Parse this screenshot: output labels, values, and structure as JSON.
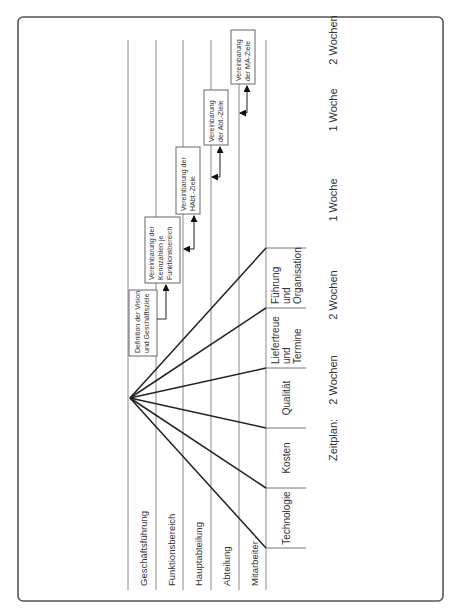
{
  "diagram": {
    "levels": [
      {
        "label": "Geschäftsführung"
      },
      {
        "label": "Funktionsbereich"
      },
      {
        "label": "Hauptabteilung"
      },
      {
        "label": "Abteilung"
      },
      {
        "label": "Mitarbeiter"
      }
    ],
    "categories": [
      {
        "lines": [
          "Technologie"
        ]
      },
      {
        "lines": [
          "Kosten"
        ]
      },
      {
        "lines": [
          "Qualität"
        ]
      },
      {
        "lines": [
          "Liefertreue",
          "und",
          "Termine"
        ]
      },
      {
        "lines": [
          "Führung",
          "und",
          "Organisation"
        ]
      }
    ],
    "steps": [
      {
        "lines": [
          "Definition der Vision",
          "und Geschäftsziele"
        ]
      },
      {
        "lines": [
          "Vereinbarung der",
          "Kennzahlen je",
          "Funktionsbereich"
        ]
      },
      {
        "lines": [
          "Vereinbarung der",
          "HAbt.-Ziele"
        ]
      },
      {
        "lines": [
          "Vereinbarung",
          "der Abt.-Ziele"
        ]
      },
      {
        "lines": [
          "Vereinbarung",
          "der MA-Ziele"
        ]
      }
    ],
    "schedule": {
      "label": "Zeitplan:",
      "durations": [
        "2 Wochen",
        "2 Wochen",
        "1 Woche",
        "1 Woche",
        "2 Wochen"
      ]
    },
    "colors": {
      "line": "#222222",
      "frame": "#555555"
    }
  }
}
